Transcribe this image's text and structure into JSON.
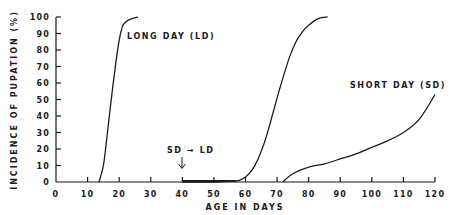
{
  "chart_data": {
    "type": "line",
    "title": "",
    "xlabel": "AGE IN DAYS",
    "ylabel": "INCIDENCE OF PUPATION (%)",
    "xlim": [
      0,
      120
    ],
    "ylim": [
      0,
      100
    ],
    "xticks": [
      0,
      10,
      20,
      30,
      40,
      50,
      60,
      70,
      80,
      90,
      100,
      110,
      120
    ],
    "yticks": [
      0,
      10,
      20,
      30,
      40,
      50,
      60,
      70,
      80,
      90,
      100
    ],
    "grid": false,
    "legend": "none (inline labels)",
    "series": [
      {
        "name": "LONG DAY (LD)",
        "x": [
          13.6,
          15,
          16,
          17,
          18,
          19,
          20,
          21,
          22,
          24,
          26
        ],
        "y": [
          0,
          10,
          25,
          42,
          58,
          73,
          86,
          94,
          97,
          99,
          100
        ]
      },
      {
        "name": "SD → LD",
        "x": [
          40,
          50,
          55,
          58,
          60,
          62,
          64,
          66,
          68,
          70,
          72,
          74,
          76,
          78,
          80,
          83,
          86
        ],
        "y": [
          0,
          0,
          0.5,
          1,
          3,
          7,
          14,
          24,
          37,
          51,
          64,
          76,
          85,
          91,
          95,
          99,
          100
        ]
      },
      {
        "name": "SHORT DAY (SD)",
        "x": [
          71.8,
          75,
          80,
          85,
          90,
          95,
          100,
          105,
          110,
          115,
          120
        ],
        "y": [
          0,
          5,
          9,
          11,
          14,
          17,
          21,
          25,
          30,
          38,
          53
        ]
      }
    ],
    "annotations": [
      {
        "text": "SD → LD",
        "x": 40,
        "y": 14,
        "arrow_to": [
          40,
          1
        ]
      }
    ]
  },
  "labels": {
    "ld": "LONG DAY (LD)",
    "sd": "SHORT DAY (SD)",
    "sd_ld": "SD → LD",
    "xlabel": "AGE IN DAYS",
    "ylabel": "INCIDENCE OF PUPATION (%)"
  }
}
